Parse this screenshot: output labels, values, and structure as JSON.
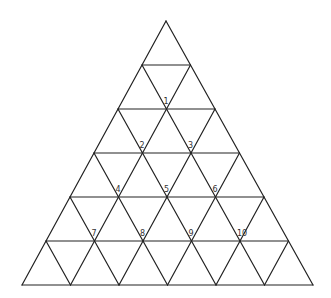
{
  "diagram": {
    "type": "triangular-grid",
    "rows": 6,
    "apex": [
      166,
      21
    ],
    "bottom_left": [
      22,
      285
    ],
    "bottom_right": [
      313,
      285
    ],
    "line_color": "#222222",
    "label_color": "#333333",
    "background": "#ffffff"
  },
  "labels": [
    {
      "text": "1",
      "row": 2,
      "index": 1
    },
    {
      "text": "2",
      "row": 3,
      "index": 1
    },
    {
      "text": "3",
      "row": 3,
      "index": 2
    },
    {
      "text": "4",
      "row": 4,
      "index": 1
    },
    {
      "text": "5",
      "row": 4,
      "index": 2
    },
    {
      "text": "6",
      "row": 4,
      "index": 3
    },
    {
      "text": "7",
      "row": 5,
      "index": 1
    },
    {
      "text": "8",
      "row": 5,
      "index": 2
    },
    {
      "text": "9",
      "row": 5,
      "index": 3
    },
    {
      "text": "10",
      "row": 5,
      "index": 4
    }
  ]
}
